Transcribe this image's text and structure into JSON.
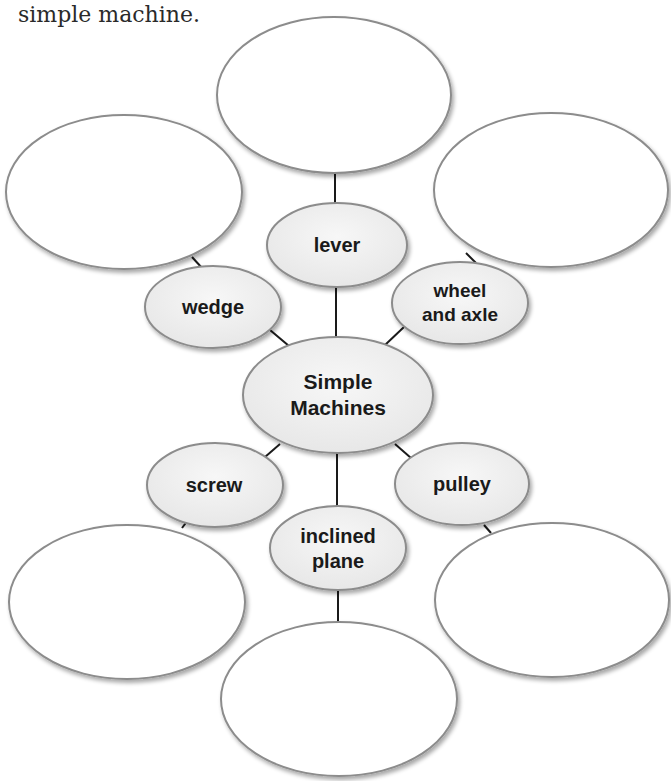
{
  "header": {
    "line_top_fragment": "",
    "line_bottom": "simple machine."
  },
  "diagram": {
    "type": "concept-web",
    "center": {
      "label_line1": "Simple",
      "label_line2": "Machines"
    },
    "branches": [
      {
        "id": "lever",
        "label_line1": "lever",
        "label_line2": ""
      },
      {
        "id": "wedge",
        "label_line1": "wedge",
        "label_line2": ""
      },
      {
        "id": "wheel-and-axle",
        "label_line1": "wheel",
        "label_line2": "and axle"
      },
      {
        "id": "screw",
        "label_line1": "screw",
        "label_line2": ""
      },
      {
        "id": "pulley",
        "label_line1": "pulley",
        "label_line2": ""
      },
      {
        "id": "inclined-plane",
        "label_line1": "inclined",
        "label_line2": "plane"
      }
    ],
    "answer_ovals": [
      {
        "id": "lever-answer",
        "value": ""
      },
      {
        "id": "wedge-answer",
        "value": ""
      },
      {
        "id": "wheel-and-axle-answer",
        "value": ""
      },
      {
        "id": "screw-answer",
        "value": ""
      },
      {
        "id": "pulley-answer",
        "value": ""
      },
      {
        "id": "inclined-plane-answer",
        "value": ""
      }
    ],
    "colors": {
      "outline": "#8c8c8c",
      "connector": "#1a1a1a",
      "node_fill": "#efefef",
      "answer_fill": "#ffffff"
    }
  }
}
